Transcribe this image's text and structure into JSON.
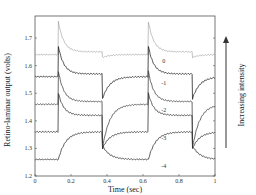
{
  "chart_data": {
    "type": "line",
    "title": "",
    "xlabel": "Time (sec)",
    "ylabel": "Retino-laminar output (volts)",
    "xlim": [
      0,
      1
    ],
    "ylim": [
      1.2,
      1.78
    ],
    "x_ticks": [
      "0",
      "0.2",
      "0.4",
      "0.6",
      "0.8",
      "1"
    ],
    "y_ticks": [
      "1.2",
      "1.3",
      "1.4",
      "1.5",
      "1.6",
      "1.7"
    ],
    "grid": false,
    "legend": "none",
    "annotation": {
      "text": "Increasing intensity",
      "arrow": "up"
    },
    "stimulus_on": [
      [
        0.13,
        0.375
      ],
      [
        0.63,
        0.875
      ]
    ],
    "series": [
      {
        "name": "0",
        "baseline": 1.64,
        "on_peak": 1.76,
        "on_steady": 1.65,
        "off_dip": 1.63,
        "color": "#999999"
      },
      {
        "name": "-1",
        "baseline": 1.56,
        "on_peak": 1.67,
        "on_steady": 1.57,
        "off_dip": 1.48,
        "color": "#222222"
      },
      {
        "name": "-2",
        "baseline": 1.46,
        "on_peak": 1.58,
        "on_steady": 1.47,
        "off_dip": 1.3,
        "color": "#444444"
      },
      {
        "name": "-3",
        "baseline": 1.36,
        "on_peak": 1.5,
        "on_steady": 1.42,
        "off_dip": 1.3,
        "color": "#333333"
      },
      {
        "name": "-4",
        "baseline": 1.26,
        "on_peak": 1.26,
        "on_steady": 1.36,
        "off_dip": 1.31,
        "color": "#333333"
      }
    ]
  }
}
